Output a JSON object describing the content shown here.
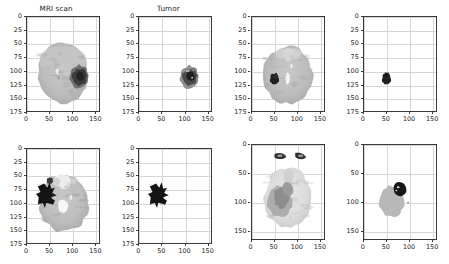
{
  "figure": {
    "kind": "matplotlib-subplot-grid",
    "rows": 2,
    "cols": 4,
    "background": "#ffffff",
    "axes_color": "#3a3a3a",
    "grid_color": "#d6d6d6",
    "grid_on": true,
    "tick_fontsize_px": 6.4,
    "title_fontsize_px": 7.2
  },
  "titles": {
    "mri": "MRI scan",
    "tumor": "Tumor",
    "blank": ""
  },
  "axis_ticks": {
    "x_025": [
      "0",
      "50",
      "100",
      "150"
    ],
    "y_025": [
      "0",
      "25",
      "50",
      "75",
      "100",
      "125",
      "150",
      "175"
    ],
    "y_050": [
      "0",
      "50",
      "100",
      "150"
    ]
  },
  "axis_ranges": {
    "x": [
      0,
      160
    ],
    "y_175": [
      175,
      0
    ],
    "y_160": [
      165,
      0
    ]
  },
  "chart_data": {
    "type": "heatmap",
    "xlabel": "",
    "ylabel": "",
    "grid": true,
    "legend": "none",
    "colormap": "gray",
    "panels": [
      {
        "index": 0,
        "row": 0,
        "col": 0,
        "title": "MRI scan",
        "content": "brain-mri-slice",
        "xlim": [
          0,
          160
        ],
        "ylim": [
          175,
          0
        ],
        "xticks": [
          0,
          50,
          100,
          150
        ],
        "yticks": [
          0,
          25,
          50,
          75,
          100,
          125,
          150,
          175
        ],
        "description": "Axial brain MRI, mid-gray tissue spanning x 20-140, y 55-155, with a dark hypointense tumor mass in the left-of-image hemisphere centered near x 115, y 110, and a small bright focus near x 68, y 100",
        "tumor_centroid": [
          115,
          110
        ],
        "tumor_extent": [
          95,
          138,
          88,
          135
        ]
      },
      {
        "index": 1,
        "row": 0,
        "col": 1,
        "title": "Tumor",
        "content": "tumor-mask",
        "xlim": [
          0,
          160
        ],
        "ylim": [
          175,
          0
        ],
        "xticks": [
          0,
          50,
          100,
          150
        ],
        "yticks": [
          0,
          25,
          50,
          75,
          100,
          125,
          150,
          175
        ],
        "description": "Segmentation mask isolating the tumor region only; gray mass with darker core centered near x 112, y 112",
        "tumor_centroid": [
          112,
          112
        ],
        "tumor_extent": [
          96,
          130,
          90,
          133
        ]
      },
      {
        "index": 2,
        "row": 0,
        "col": 2,
        "title": "",
        "content": "brain-mri-slice",
        "xlim": [
          0,
          160
        ],
        "ylim": [
          175,
          0
        ],
        "xticks": [
          0,
          50,
          100,
          150
        ],
        "yticks": [
          0,
          25,
          50,
          75,
          100,
          125,
          150,
          175
        ],
        "description": "Axial brain MRI at skull-base level, tissue spanning x 18-142, y 60-158, with a small black tumor near x 50, y 115 and a bright ventricle structure near x 82, y 118",
        "tumor_centroid": [
          50,
          115
        ],
        "tumor_extent": [
          40,
          62,
          103,
          128
        ]
      },
      {
        "index": 3,
        "row": 0,
        "col": 3,
        "title": "",
        "content": "tumor-mask",
        "xlim": [
          0,
          160
        ],
        "ylim": [
          175,
          0
        ],
        "xticks": [
          0,
          50,
          100,
          150
        ],
        "yticks": [
          0,
          25,
          50,
          75,
          100,
          125,
          150,
          175
        ],
        "description": "Small compact dark tumor mask near x 50, y 115",
        "tumor_centroid": [
          50,
          115
        ],
        "tumor_extent": [
          41,
          60,
          104,
          127
        ]
      },
      {
        "index": 4,
        "row": 1,
        "col": 0,
        "title": "",
        "content": "brain-mri-slice",
        "xlim": [
          0,
          160
        ],
        "ylim": [
          175,
          0
        ],
        "xticks": [
          0,
          50,
          100,
          150
        ],
        "yticks": [
          0,
          25,
          50,
          75,
          100,
          125,
          150,
          175
        ],
        "description": "Axial brain MRI with cerebellum, tissue spanning x 20-145, y 45-150, with a large black tumor region on the image-left side around x 25-60, y 70-110 and bright central ventricles near x 78, y 105",
        "tumor_centroid": [
          42,
          92
        ],
        "tumor_extent": [
          20,
          62,
          62,
          115
        ]
      },
      {
        "index": 5,
        "row": 1,
        "col": 1,
        "title": "",
        "content": "tumor-mask",
        "xlim": [
          0,
          160
        ],
        "ylim": [
          175,
          0
        ],
        "xticks": [
          0,
          50,
          100,
          150
        ],
        "yticks": [
          0,
          25,
          50,
          75,
          100,
          125,
          150,
          175
        ],
        "description": "Irregular star/arrow shaped black tumor mask spanning x 22-62, y 65-115",
        "tumor_centroid": [
          42,
          92
        ],
        "tumor_extent": [
          22,
          62,
          65,
          115
        ]
      },
      {
        "index": 6,
        "row": 1,
        "col": 2,
        "title": "",
        "content": "brain-mri-slice",
        "xlim": [
          0,
          160
        ],
        "ylim": [
          165,
          0
        ],
        "xticks": [
          0,
          50,
          100,
          150
        ],
        "yticks": [
          0,
          50,
          100,
          150
        ],
        "description": "Pale axial brain MRI with two dark orbital structures near y 20, tissue spanning x 15-145, y 35-145, and a mid-gray tumor region centered near x 62, y 100",
        "tumor_centroid": [
          62,
          100
        ],
        "tumor_extent": [
          35,
          95,
          70,
          130
        ]
      },
      {
        "index": 7,
        "row": 1,
        "col": 3,
        "title": "",
        "content": "tumor-mask",
        "xlim": [
          0,
          160
        ],
        "ylim": [
          165,
          0
        ],
        "xticks": [
          0,
          50,
          100,
          150
        ],
        "yticks": [
          0,
          50,
          100,
          150
        ],
        "description": "Two-level tumor mask: light-gray edema region x 30-105, y 70-130 with a dark solid core near x 62-88, y 75-95",
        "tumor_centroid": [
          62,
          98
        ],
        "tumor_extent": [
          30,
          105,
          70,
          130
        ]
      }
    ]
  }
}
